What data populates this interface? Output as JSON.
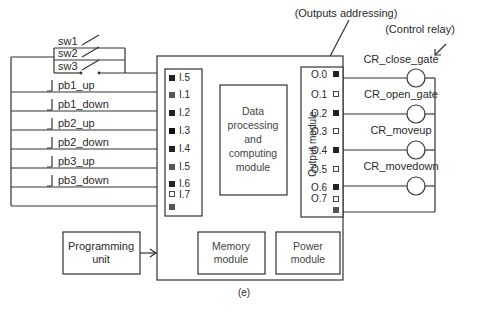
{
  "annotations": {
    "outputs_addressing": "(Outputs addressing)",
    "control_relay": "(Control relay)",
    "figure_label": "(e)"
  },
  "switches": [
    {
      "label": "sw1"
    },
    {
      "label": "sw2"
    },
    {
      "label": "sw3"
    }
  ],
  "pushbuttons": [
    {
      "label": "pb1_up"
    },
    {
      "label": "pb1_down"
    },
    {
      "label": "pb2_up"
    },
    {
      "label": "pb2_down"
    },
    {
      "label": "pb3_up"
    },
    {
      "label": "pb3_down"
    }
  ],
  "input_module": {
    "inputs": [
      {
        "address": "I.5",
        "state": "dark"
      },
      {
        "address": "I.1",
        "state": "gray"
      },
      {
        "address": "I.2",
        "state": "dark"
      },
      {
        "address": "I.3",
        "state": "dark"
      },
      {
        "address": "I.4",
        "state": "dark"
      },
      {
        "address": "I.5",
        "state": "gray"
      },
      {
        "address": "I.6",
        "state": "dark"
      },
      {
        "address": "I.7",
        "state": "empty"
      },
      {
        "address": "",
        "state": "gray"
      }
    ]
  },
  "cpu_module": {
    "lines": [
      "Data",
      "processing",
      "and",
      "computing",
      "module"
    ]
  },
  "output_module": {
    "title": "Output module",
    "outputs": [
      {
        "address": "O.0",
        "state": "dark"
      },
      {
        "address": "O.1",
        "state": "empty"
      },
      {
        "address": "O.2",
        "state": "dark"
      },
      {
        "address": "O.3",
        "state": "empty"
      },
      {
        "address": "O.4",
        "state": "dark"
      },
      {
        "address": "O.5",
        "state": "empty"
      },
      {
        "address": "O.6",
        "state": "dark"
      },
      {
        "address": "O.7",
        "state": "empty"
      },
      {
        "address": "",
        "state": "gray"
      }
    ]
  },
  "relays": [
    {
      "label": "CR_close_gate"
    },
    {
      "label": "CR_open_gate"
    },
    {
      "label": "CR_moveup"
    },
    {
      "label": "CR_movedown"
    }
  ],
  "memory_module": {
    "lines": [
      "Memory",
      "module"
    ]
  },
  "power_module": {
    "lines": [
      "Power",
      "module"
    ]
  },
  "programming_unit": {
    "lines": [
      "Programming",
      "unit"
    ]
  },
  "colors": {
    "dark": "#222222",
    "gray": "#555555",
    "line": "#333333"
  }
}
